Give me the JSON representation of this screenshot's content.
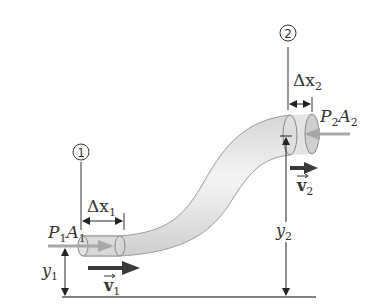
{
  "diagram": {
    "point1": {
      "marker": "1",
      "pressure_force_P": "P",
      "pressure_force_sub1": "1",
      "pressure_force_A": "A",
      "pressure_force_sub2": "1",
      "displacement": "Δx",
      "displacement_sub": "1",
      "height": "y",
      "height_sub": "1",
      "velocity": "v",
      "velocity_sub": "1"
    },
    "point2": {
      "marker": "2",
      "pressure_force_P": "P",
      "pressure_force_sub1": "2",
      "pressure_force_A": "A",
      "pressure_force_sub2": "2",
      "displacement": "Δx",
      "displacement_sub": "2",
      "height": "y",
      "height_sub": "2",
      "velocity": "v",
      "velocity_sub": "2"
    },
    "colors": {
      "line": "#333333",
      "pressure_arrow": "#a8a8a8",
      "velocity_arrow": "#3a3a3a",
      "pipe_fill": "#e6e6e6",
      "pipe_edge": "#9a9a9a"
    }
  }
}
